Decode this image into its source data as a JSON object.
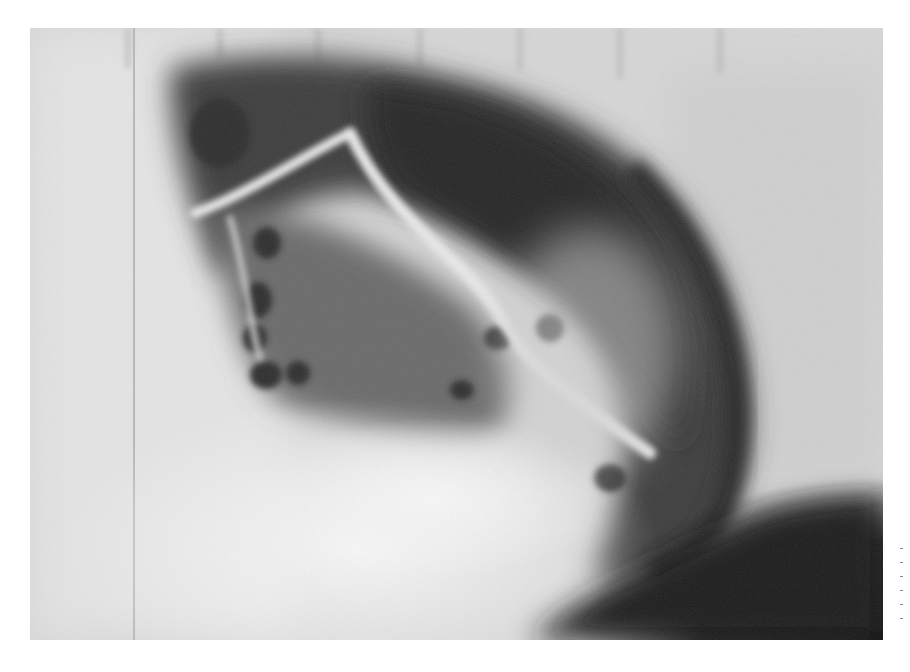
{
  "image": {
    "kind": "grayscale radiograph",
    "description": "Lateral X-ray film showing a large dark gas-filled crescent-shaped shadow with rounded dark loops and bright linear structures, bright opaque lower-left area, dark lower-right corner",
    "colors": {
      "border": "#ffffff",
      "light_field": "#d9d9d9",
      "bright_area": "#f2f2f2",
      "gas_shadow": "#3a3a3a",
      "dark_corner": "#141414",
      "bright_lines": "#e6e6e6"
    }
  }
}
